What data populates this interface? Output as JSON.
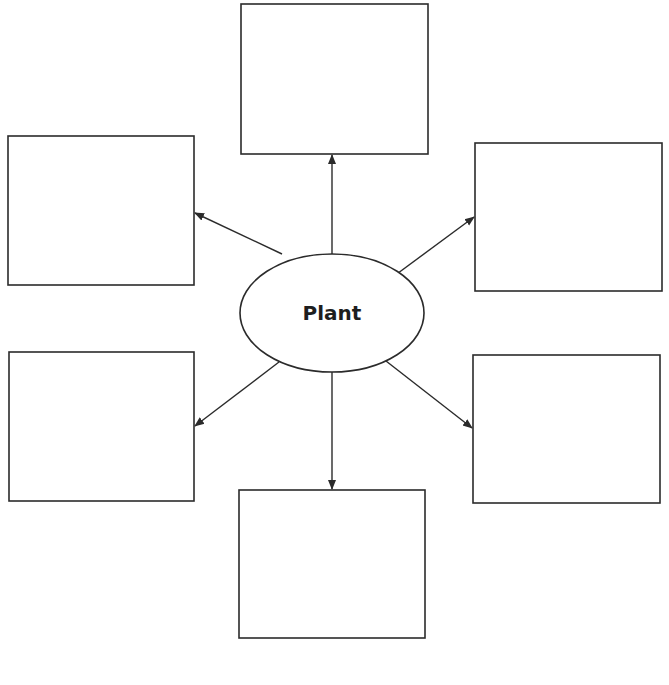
{
  "diagram": {
    "type": "concept-web",
    "center": {
      "label": "Plant",
      "cx": 332,
      "cy": 313,
      "rx": 92,
      "ry": 59
    },
    "colors": {
      "stroke": "#2b2b2b",
      "background": "#ffffff",
      "text": "#1e1e1e"
    },
    "boxes": [
      {
        "id": "top",
        "label": "",
        "x": 241,
        "y": 4,
        "w": 187,
        "h": 150
      },
      {
        "id": "top-left",
        "label": "",
        "x": 8,
        "y": 136,
        "w": 186,
        "h": 149
      },
      {
        "id": "top-right",
        "label": "",
        "x": 475,
        "y": 143,
        "w": 187,
        "h": 148
      },
      {
        "id": "bottom-left",
        "label": "",
        "x": 9,
        "y": 352,
        "w": 185,
        "h": 149
      },
      {
        "id": "bottom-right",
        "label": "",
        "x": 473,
        "y": 355,
        "w": 187,
        "h": 148
      },
      {
        "id": "bottom",
        "label": "",
        "x": 239,
        "y": 490,
        "w": 186,
        "h": 148
      }
    ],
    "arrows": [
      {
        "to": "top",
        "x1": 332,
        "y1": 254,
        "x2": 332,
        "y2": 155
      },
      {
        "to": "top-left",
        "x1": 282,
        "y1": 254,
        "x2": 195,
        "y2": 213
      },
      {
        "to": "top-right",
        "x1": 386,
        "y1": 282,
        "x2": 474,
        "y2": 217
      },
      {
        "to": "bottom-left",
        "x1": 279,
        "y1": 362,
        "x2": 195,
        "y2": 426
      },
      {
        "to": "bottom-right",
        "x1": 386,
        "y1": 361,
        "x2": 472,
        "y2": 428
      },
      {
        "to": "bottom",
        "x1": 332,
        "y1": 372,
        "x2": 332,
        "y2": 489
      }
    ]
  }
}
